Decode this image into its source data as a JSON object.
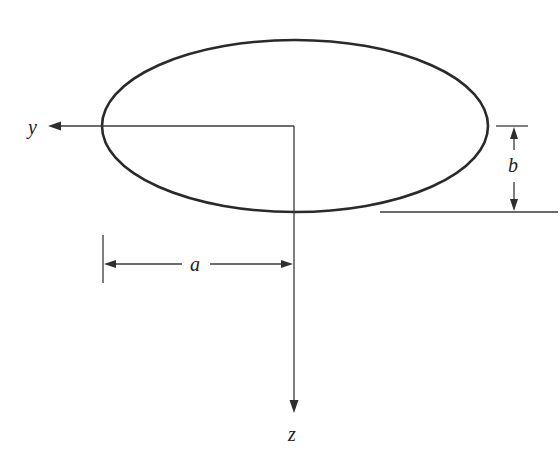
{
  "diagram": {
    "type": "ellipse-cross-section",
    "ellipse": {
      "cx": 295,
      "cy": 126,
      "rx": 193,
      "ry": 86
    },
    "axes": {
      "y": {
        "label": "y",
        "direction": "left"
      },
      "z": {
        "label": "z",
        "direction": "down"
      }
    },
    "dimensions": {
      "a": {
        "label": "a",
        "meaning": "horizontal semi-axis"
      },
      "b": {
        "label": "b",
        "meaning": "vertical semi-axis"
      }
    },
    "colors": {
      "stroke": "#2a2a2a",
      "background": "#ffffff"
    }
  }
}
